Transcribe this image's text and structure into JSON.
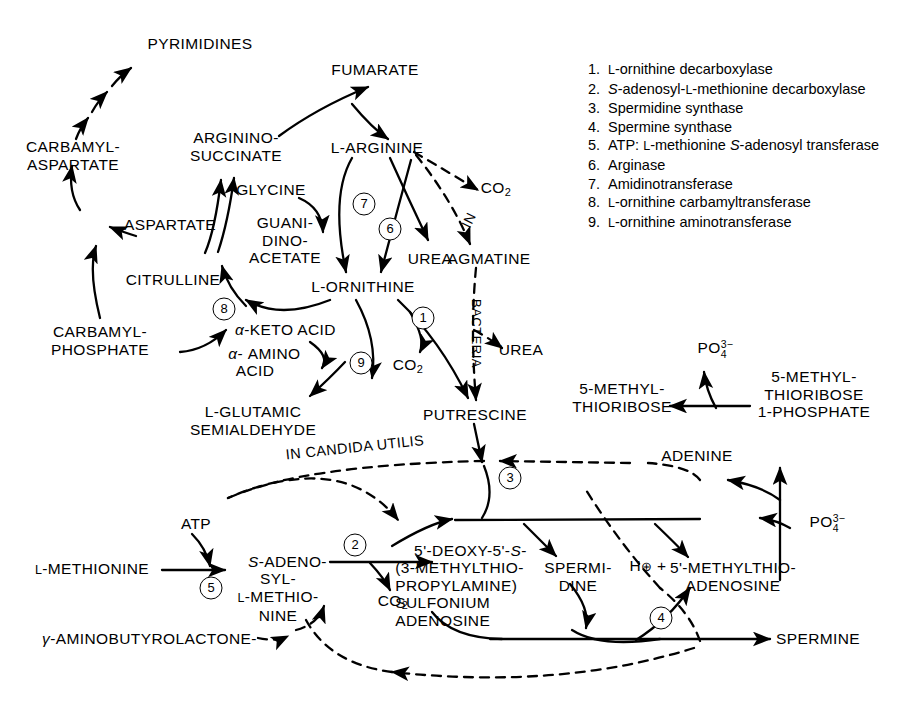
{
  "diagram": {
    "nodes": {
      "pyrimidines": "PYRIMIDINES",
      "carbamyl_aspartate": "CARBAMYL-\nASPARTATE",
      "aspartate": "ASPARTATE",
      "citrulline": "CITRULLINE",
      "carbamyl_phosphate": "CARBAMYL-\nPHOSPHATE",
      "argininosuccinate": "ARGININO-\nSUCCINATE",
      "fumarate": "FUMARATE",
      "l_arginine": "L-ARGININE",
      "glycine": "GLYCINE",
      "guanidinoacetate": "GUANI-\nDINO-\nACETATE",
      "urea_top": "UREA",
      "l_ornithine": "L-ORNITHINE",
      "alpha_keto_acid": "α-KETO ACID",
      "alpha_amino_acid": "α-AMINO\nACID",
      "l_glutamic_semialdehyde": "L-GLUTAMIC\nSEMIALDEHYDE",
      "co2_ornithine": "CO2",
      "co2_arginine": "CO2",
      "agmatine": "AGMATINE",
      "urea_bacteria": "UREA",
      "putrescine": "PUTRESCINE",
      "in_label": "IN",
      "bacteria_label": "BACTERIA",
      "in_candida_utilis": "IN CANDIDA UTILIS",
      "atp": "ATP",
      "l_methionine": "L-METHIONINE",
      "sam": "S-ADENO-\nSYL-\nL-METHIO-\nNINE",
      "co2_sam": "CO2",
      "decarboxylated_sam": "5'-DEOXY-5'-S-\n(3-METHYLTHIO-\nPROPYLAMINE)\nSULFONIUM\nADENOSINE",
      "spermidine": "SPERMI-\nDINE",
      "h_plus": "H⊕ +",
      "mta": "5'-METHYLTHIO-\nADENOSINE",
      "spermine": "SPERMINE",
      "gamma_aminobutyrolactone": "γ-AMINOBUTYROLACTONE-",
      "adenine": "ADENINE",
      "mtr_1_phosphate": "5-METHYL-\nTHIORIBOSE\n1-PHOSPHATE",
      "mtr": "5-METHYL-\nTHIORIBOSE",
      "phosphate_top": "PO4 3-",
      "phosphate_bottom": "PO4 3-"
    },
    "enzyme_markers": [
      "1",
      "2",
      "3",
      "4",
      "5",
      "6",
      "7",
      "8",
      "9"
    ]
  },
  "legend": {
    "items": [
      {
        "num": "1.",
        "text": "L-ornithine decarboxylase"
      },
      {
        "num": "2.",
        "text": "S-adenosyl-L-methionine decarboxylase"
      },
      {
        "num": "3.",
        "text": "Spermidine synthase"
      },
      {
        "num": "4.",
        "text": "Spermine synthase"
      },
      {
        "num": "5.",
        "text": "ATP: L-methionine S-adenosyl transferase"
      },
      {
        "num": "6.",
        "text": "Arginase"
      },
      {
        "num": "7.",
        "text": "Amidinotransferase"
      },
      {
        "num": "8.",
        "text": "L-ornithine carbamyltransferase"
      },
      {
        "num": "9.",
        "text": "L-ornithine aminotransferase"
      }
    ]
  },
  "colors": {
    "ink": "#000000",
    "background": "#ffffff"
  }
}
